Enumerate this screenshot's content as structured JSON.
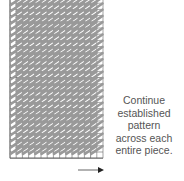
{
  "figure": {
    "caption_lines": [
      "Continue",
      "established",
      "pattern",
      "across each",
      "entire piece."
    ],
    "grid": {
      "left": 10,
      "top": -3,
      "cols": 15,
      "rows": 26,
      "cell": 6.2,
      "grid_color": "#666666",
      "stitch_color": "#999999",
      "emphasis_row_line": 13,
      "emphasis_col_line": 13
    },
    "arrow": {
      "x1": 78,
      "x2": 104,
      "y": 170,
      "color": "#999999",
      "head_color": "#222222"
    }
  }
}
